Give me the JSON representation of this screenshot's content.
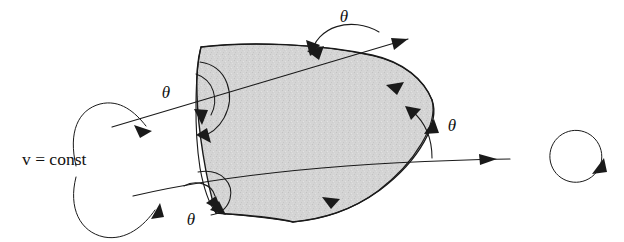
{
  "figure": {
    "background_color": "#ffffff",
    "ink_color": "#1a1a1a",
    "shade_color": "#d2d2d2",
    "width": 624,
    "height": 242
  },
  "labels": {
    "v_const": {
      "variable": "v",
      "equals": " = ",
      "value": "const",
      "full": "v = const",
      "x": 22,
      "y": 165
    },
    "theta_top": {
      "text": "θ",
      "x": 344,
      "y": 22
    },
    "theta_left": {
      "text": "θ",
      "x": 166,
      "y": 98
    },
    "theta_right": {
      "text": "θ",
      "x": 452,
      "y": 131
    },
    "theta_bottom": {
      "text": "θ",
      "x": 191,
      "y": 225
    }
  },
  "annotations": {
    "angle_symbol": "θ",
    "angle_count": 4,
    "orientation_circle": {
      "name": "orientation-arrow",
      "direction": "counterclockwise",
      "center_x": 578,
      "center_y": 152,
      "radius": 26
    },
    "straight_lines": [
      {
        "name": "upper-v-const-line",
        "description": "straight line rising left to right crossing upper part of region"
      },
      {
        "name": "lower-v-const-line",
        "description": "near-horizontal straight line crossing lower part of region"
      }
    ],
    "leader_arrows": [
      {
        "name": "leader-to-upper-line",
        "from": "v = const",
        "to": "upper-v-const-line"
      },
      {
        "name": "leader-to-lower-line",
        "from": "v = const",
        "to": "lower-v-const-line"
      }
    ],
    "region": {
      "name": "shaded-curvilinear-region",
      "fill": "#d2d2d2",
      "edges": 4,
      "edge_type": "curved"
    }
  }
}
